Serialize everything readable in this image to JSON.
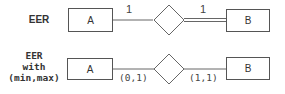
{
  "rows": [
    {
      "label": "EER",
      "entity_a": "A",
      "entity_b": "B",
      "card_a": "1",
      "card_b": "1",
      "b_participation": "total"
    },
    {
      "label_lines": [
        "EER",
        "with",
        "(min,max)"
      ],
      "entity_a": "A",
      "entity_b": "B",
      "card_a": "(0,1)",
      "card_b": "(1,1)",
      "b_participation": "partial"
    }
  ]
}
